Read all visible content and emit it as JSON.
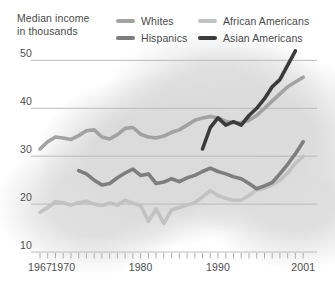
{
  "header": {
    "line1": "Median income",
    "line2": "in thousands"
  },
  "legend": [
    {
      "label": "Whites",
      "color": "#a2a2a2"
    },
    {
      "label": "African Americans",
      "color": "#c2c2c2"
    },
    {
      "label": "Hispanics",
      "color": "#7e7e7e"
    },
    {
      "label": "Asian Americans",
      "color": "#3b3b3b"
    }
  ],
  "colors": {
    "gridline": "#b5b5b5",
    "tick": "#a5a5a5",
    "text": "#4e4e4e",
    "background_blob": "#dcdcdc"
  },
  "chart_data": {
    "type": "line",
    "title": "Median income in thousands",
    "grid": "horizontal-only",
    "legend_position": "top",
    "x_axis": {
      "range": [
        1967,
        2001
      ],
      "tick_every_year": true,
      "label_years": [
        1967,
        1970,
        1980,
        1990,
        2001
      ],
      "tick_labels": [
        "1967",
        "1970",
        "1980",
        "1990",
        "2001"
      ]
    },
    "y_axis": {
      "range": [
        10,
        50
      ],
      "gridline_values": [
        10,
        20,
        30,
        40,
        50
      ],
      "tick_labels": [
        "10",
        "20",
        "30",
        "40",
        "50"
      ]
    },
    "series": [
      {
        "name": "Whites",
        "color": "#a2a2a2",
        "start_year": 1967,
        "values": [
          31.5,
          33,
          34,
          33.8,
          33.5,
          34.3,
          35.3,
          35.5,
          34,
          33.6,
          34.5,
          35.8,
          36,
          34.6,
          34,
          33.8,
          34.2,
          35,
          35.5,
          36.5,
          37.5,
          38,
          38.3,
          38,
          37.3,
          37,
          37,
          37.5,
          38.5,
          40,
          41.5,
          43,
          44.5,
          45.5,
          46.5
        ]
      },
      {
        "name": "African Americans",
        "color": "#c2c2c2",
        "start_year": 1967,
        "values": [
          18.3,
          19.3,
          20.5,
          20.3,
          19.8,
          20.3,
          20.6,
          20,
          19.7,
          20.2,
          19.8,
          20.8,
          20.2,
          19.7,
          16.4,
          19,
          16,
          18.8,
          19.3,
          19.8,
          20.3,
          21.5,
          22.8,
          21.8,
          21.2,
          20.8,
          20.8,
          21.8,
          23,
          23.3,
          24,
          25,
          26.5,
          28.5,
          30
        ]
      },
      {
        "name": "Hispanics",
        "color": "#7e7e7e",
        "start_year": 1972,
        "values": [
          27,
          26.3,
          25,
          24,
          24.3,
          25.5,
          26.5,
          27.3,
          26,
          26.3,
          24.3,
          24.6,
          25.3,
          24.7,
          25.5,
          26,
          26.8,
          27.5,
          26.8,
          26.3,
          25.7,
          25.3,
          24.3,
          23.2,
          23.8,
          24.5,
          26.3,
          28.3,
          30.5,
          33
        ]
      },
      {
        "name": "Asian Americans",
        "color": "#3b3b3b",
        "start_year": 1988,
        "values": [
          31.5,
          36,
          38,
          36.5,
          37.2,
          36.5,
          38.5,
          40,
          42,
          44.5,
          46,
          49,
          52
        ]
      }
    ]
  }
}
